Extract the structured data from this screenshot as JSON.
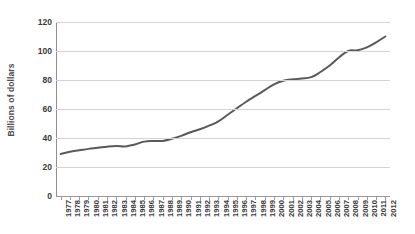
{
  "chart_data": {
    "type": "line",
    "title": "",
    "xlabel": "",
    "ylabel": "Billions of dollars",
    "ylim": [
      0,
      120
    ],
    "yticks": [
      0,
      20,
      40,
      60,
      80,
      100,
      120
    ],
    "grid": true,
    "legend": "none",
    "line_color": "#595959",
    "categories": [
      "1977",
      "1978",
      "1979",
      "1980",
      "1981",
      "1982",
      "1983",
      "1984",
      "1985",
      "1986",
      "1987",
      "1988",
      "1989",
      "1990",
      "1991",
      "1992",
      "1993",
      "1994",
      "1995",
      "1996",
      "1997",
      "1998",
      "1999",
      "2000",
      "2001",
      "2002",
      "2003",
      "2004",
      "2005",
      "2006",
      "2007",
      "2008",
      "2009",
      "2010",
      "2011",
      "2012"
    ],
    "values": [
      29,
      30.5,
      31.5,
      32.5,
      33.2,
      34,
      34.4,
      34.2,
      35.5,
      37.5,
      38,
      38,
      39.5,
      41.5,
      44,
      46,
      48.5,
      51.5,
      56,
      60.5,
      65,
      69,
      73,
      77,
      79.5,
      80.5,
      81,
      82,
      85.5,
      90,
      95.5,
      100,
      100.5,
      102.5,
      106,
      110
    ]
  }
}
